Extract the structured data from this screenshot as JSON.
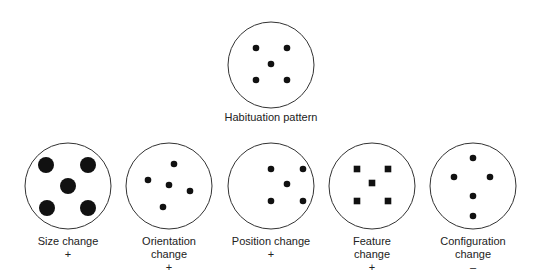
{
  "top": {
    "label": "Habituation pattern",
    "circle": {
      "cx": 271,
      "cy": 65,
      "r": 43
    },
    "shape": "dot",
    "points": [
      [
        256,
        48
      ],
      [
        287,
        48
      ],
      [
        271,
        64
      ],
      [
        256,
        80
      ],
      [
        287,
        80
      ]
    ],
    "size": 3.3
  },
  "tests": [
    {
      "label_line1": "Size change",
      "label_line2": "",
      "sign": "+",
      "circle": {
        "cx": 68,
        "cy": 186,
        "r": 43
      },
      "shape": "dot",
      "size": 8,
      "points": [
        [
          46,
          165
        ],
        [
          88,
          165
        ],
        [
          68,
          186
        ],
        [
          47,
          208
        ],
        [
          88,
          208
        ]
      ],
      "label_x": 68
    },
    {
      "label_line1": "Orientation",
      "label_line2": "change",
      "sign": "+",
      "circle": {
        "cx": 169,
        "cy": 186,
        "r": 43
      },
      "shape": "dot",
      "size": 3.3,
      "points": [
        [
          174,
          164
        ],
        [
          148,
          180
        ],
        [
          169,
          185
        ],
        [
          190,
          191
        ],
        [
          163,
          207
        ]
      ],
      "label_x": 169
    },
    {
      "label_line1": "Position change",
      "label_line2": "",
      "sign": "+",
      "circle": {
        "cx": 271,
        "cy": 186,
        "r": 43
      },
      "shape": "dot",
      "size": 3.3,
      "points": [
        [
          271,
          169
        ],
        [
          303,
          169
        ],
        [
          287,
          184
        ],
        [
          271,
          201
        ],
        [
          303,
          201
        ]
      ],
      "label_x": 271
    },
    {
      "label_line1": "Feature",
      "label_line2": "change",
      "sign": "+",
      "circle": {
        "cx": 372,
        "cy": 186,
        "r": 43
      },
      "shape": "square",
      "size": 3.3,
      "points": [
        [
          357,
          169
        ],
        [
          388,
          169
        ],
        [
          372,
          183
        ],
        [
          357,
          201
        ],
        [
          388,
          201
        ]
      ],
      "label_x": 372
    },
    {
      "label_line1": "Configuration",
      "label_line2": "change",
      "sign": "–",
      "circle": {
        "cx": 473,
        "cy": 186,
        "r": 43
      },
      "shape": "dot",
      "size": 3.3,
      "points": [
        [
          473,
          158
        ],
        [
          454,
          177
        ],
        [
          490,
          177
        ],
        [
          473,
          196
        ],
        [
          473,
          216
        ]
      ],
      "label_x": 473
    }
  ]
}
